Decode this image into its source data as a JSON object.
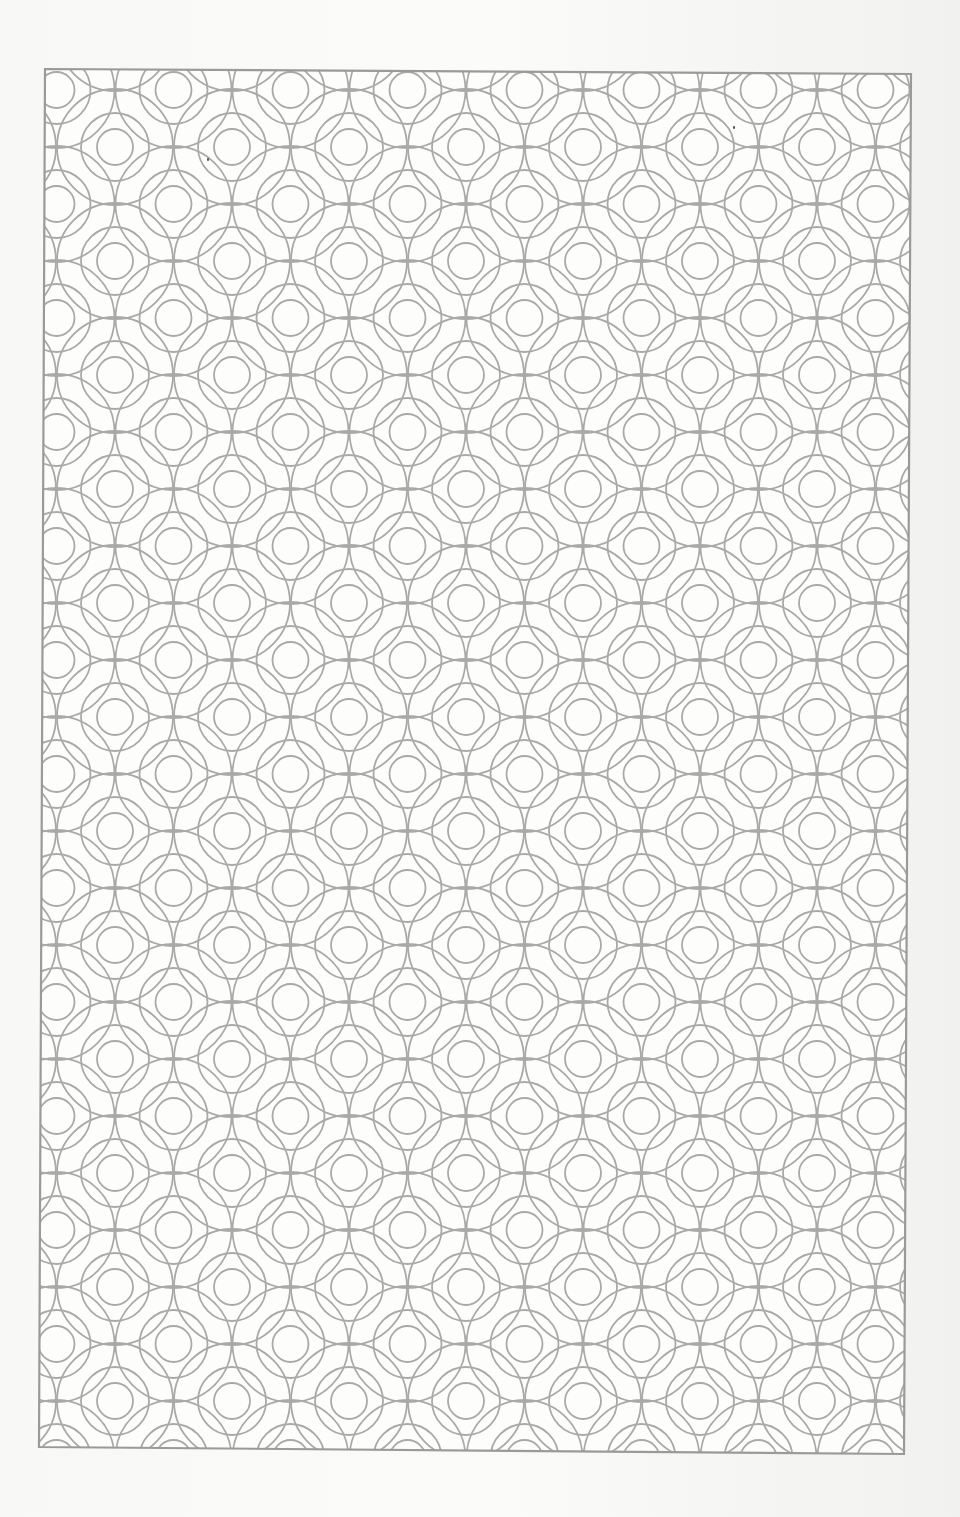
{
  "page": {
    "type": "scanned decorative pattern page",
    "background_color": "#f6f6f5"
  },
  "pattern": {
    "motif": "interlocking overlapping circles lattice",
    "line_color": "#a9a9a9",
    "frame_color": "#9a9a9a",
    "frame_corners": {
      "top_left": [
        45,
        69
      ],
      "top_right": [
        911,
        74
      ],
      "bottom_right": [
        904,
        1454
      ],
      "bottom_left": [
        39,
        1447
      ]
    },
    "cell_width": 117,
    "cell_height": 114,
    "circle_radii": [
      18,
      33,
      58
    ]
  },
  "marks": [
    {
      "name": "scan-speck",
      "x": 207,
      "y": 160
    },
    {
      "name": "scan-speck",
      "x": 733,
      "y": 128
    }
  ]
}
